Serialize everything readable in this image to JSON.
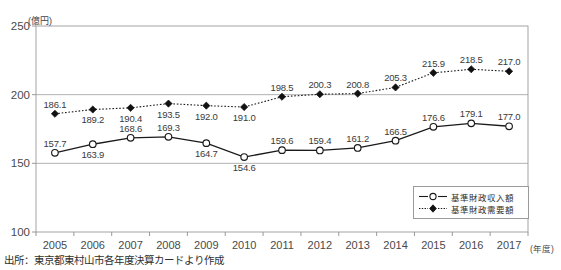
{
  "chart_title": "",
  "y_axis": {
    "unit_label": "(億円)",
    "ticks": [
      100,
      150,
      200,
      250
    ],
    "min": 100,
    "max": 250
  },
  "x_axis": {
    "unit_label": "(年度)",
    "ticks": [
      "2005",
      "2006",
      "2007",
      "2008",
      "2009",
      "2010",
      "2011",
      "2012",
      "2013",
      "2014",
      "2015",
      "2016",
      "2017"
    ]
  },
  "legend": {
    "position": "bottom-right",
    "items": [
      {
        "label": "基準財政収入額",
        "marker": "open-circle",
        "line": "solid"
      },
      {
        "label": "基準財政需要額",
        "marker": "filled-diamond",
        "line": "dotted"
      }
    ]
  },
  "source_note": "出所：東京都東村山市各年度決算カードより作成",
  "colors": {
    "line": "#1a1a1a",
    "axis": "#8f8f8f",
    "grid": "#b5b5b5",
    "text": "#3a3a3a",
    "background": "#ffffff"
  },
  "chart_data": {
    "type": "line",
    "title": "",
    "xlabel": "(年度)",
    "ylabel": "(億円)",
    "ylim": [
      100,
      250
    ],
    "grid": true,
    "legend_position": "bottom-right",
    "categories": [
      "2005",
      "2006",
      "2007",
      "2008",
      "2009",
      "2010",
      "2011",
      "2012",
      "2013",
      "2014",
      "2015",
      "2016",
      "2017"
    ],
    "series": [
      {
        "name": "基準財政収入額",
        "marker": "open-circle",
        "line": "solid",
        "values": [
          157.7,
          163.9,
          168.6,
          169.3,
          164.7,
          154.6,
          159.6,
          159.4,
          161.2,
          166.5,
          176.6,
          179.1,
          177.0
        ],
        "label_positions": [
          "above",
          "below",
          "above",
          "above",
          "below",
          "below",
          "above",
          "above",
          "above",
          "above",
          "above",
          "above",
          "above"
        ]
      },
      {
        "name": "基準財政需要額",
        "marker": "filled-diamond",
        "line": "dotted",
        "values": [
          186.1,
          189.2,
          190.4,
          193.5,
          192.0,
          191.0,
          198.5,
          200.3,
          200.8,
          205.3,
          215.9,
          218.5,
          217.0
        ],
        "label_positions": [
          "above",
          "below",
          "below",
          "below",
          "below",
          "below",
          "above",
          "above",
          "above",
          "above",
          "above",
          "above",
          "above"
        ]
      }
    ]
  }
}
